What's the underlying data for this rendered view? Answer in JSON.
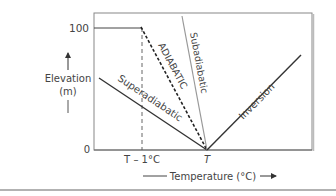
{
  "diagram": {
    "y_axis": {
      "label_line1": "Elevation",
      "label_line2": "(m)",
      "tick_top": "100",
      "tick_bottom": "0"
    },
    "x_axis": {
      "label": "Temperature (°C)",
      "tick_left": "T – 1°C",
      "tick_right": "T"
    },
    "lines": {
      "superadiabatic": "Superadiabatic",
      "adiabatic": "ADIABATIC",
      "subadiabatic": "Subadiabatic",
      "inversion": "Inversion"
    },
    "colors": {
      "frame": "#777777",
      "line_dark": "#333333",
      "line_gray": "#999999"
    }
  }
}
